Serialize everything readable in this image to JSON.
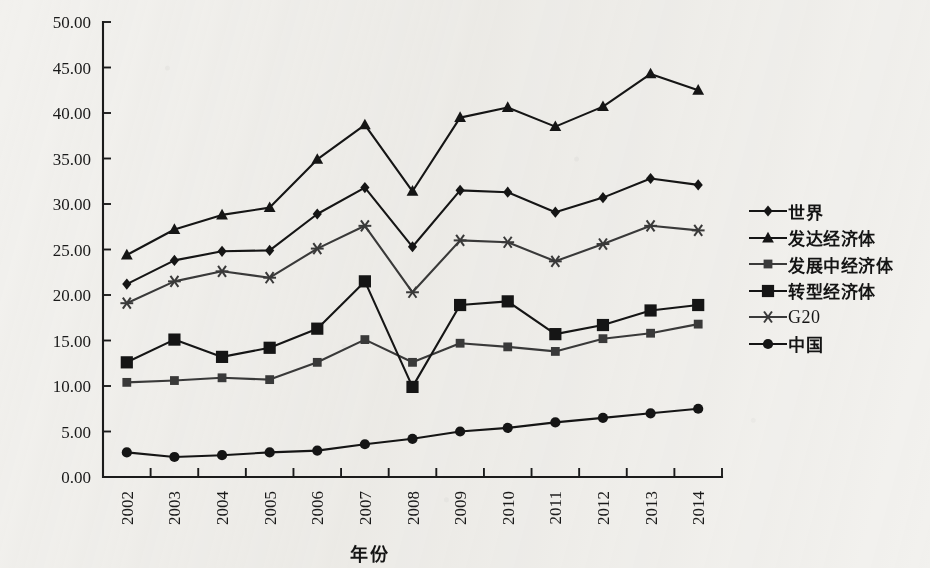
{
  "chart_data": {
    "type": "line",
    "title": "",
    "xlabel": "年份",
    "ylabel": "占比/%",
    "categories": [
      "2002",
      "2003",
      "2004",
      "2005",
      "2006",
      "2007",
      "2008",
      "2009",
      "2010",
      "2011",
      "2012",
      "2013",
      "2014"
    ],
    "x": [
      2002,
      2003,
      2004,
      2005,
      2006,
      2007,
      2008,
      2009,
      2010,
      2011,
      2012,
      2013,
      2014
    ],
    "ylim": [
      0,
      50
    ],
    "ytick_labels": [
      "0.00",
      "5.00",
      "10.00",
      "15.00",
      "20.00",
      "25.00",
      "30.00",
      "35.00",
      "40.00",
      "45.00",
      "50.00"
    ],
    "ytick_values": [
      0,
      5,
      10,
      15,
      20,
      25,
      30,
      35,
      40,
      45,
      50
    ],
    "ytick_step": 5,
    "grid": false,
    "legend_position": "right",
    "series": [
      {
        "name": "世界",
        "marker": "diamond",
        "color": "#151515",
        "values": [
          21.2,
          23.8,
          24.8,
          24.9,
          28.9,
          31.8,
          25.3,
          31.5,
          31.3,
          29.1,
          30.7,
          32.8,
          32.1
        ]
      },
      {
        "name": "发达经济体",
        "marker": "triangle",
        "color": "#151515",
        "values": [
          24.4,
          27.2,
          28.8,
          29.6,
          34.9,
          38.7,
          31.4,
          39.5,
          40.6,
          38.5,
          40.7,
          44.3,
          42.5
        ]
      },
      {
        "name": "发展中经济体",
        "marker": "square-small",
        "color": "#3a3a3a",
        "values": [
          10.4,
          10.6,
          10.9,
          10.7,
          12.6,
          15.1,
          12.6,
          14.7,
          14.3,
          13.8,
          15.2,
          15.8,
          16.8
        ]
      },
      {
        "name": "转型经济体",
        "marker": "square-large",
        "color": "#151515",
        "values": [
          12.6,
          15.1,
          13.2,
          14.2,
          16.3,
          21.5,
          9.9,
          18.9,
          19.3,
          15.7,
          16.7,
          18.3,
          18.9
        ]
      },
      {
        "name": "G20",
        "marker": "asterisk",
        "color": "#3a3a3a",
        "values": [
          19.1,
          21.5,
          22.6,
          21.9,
          25.1,
          27.6,
          20.3,
          26.0,
          25.8,
          23.7,
          25.6,
          27.6,
          27.1
        ]
      },
      {
        "name": "中国",
        "marker": "circle",
        "color": "#151515",
        "values": [
          2.7,
          2.2,
          2.4,
          2.7,
          2.9,
          3.6,
          4.2,
          5.0,
          5.4,
          6.0,
          6.5,
          7.0,
          7.5
        ]
      }
    ]
  },
  "legend": {
    "items": [
      {
        "label": "世界",
        "marker": "diamond",
        "latin": false
      },
      {
        "label": "发达经济体",
        "marker": "triangle",
        "latin": false
      },
      {
        "label": "发展中经济体",
        "marker": "square-small",
        "latin": false
      },
      {
        "label": "转型经济体",
        "marker": "square-large",
        "latin": false
      },
      {
        "label": "G20",
        "marker": "asterisk",
        "latin": true
      },
      {
        "label": "中国",
        "marker": "circle",
        "latin": false
      }
    ]
  },
  "axes": {
    "y_title": "占比/%",
    "x_title": "年份"
  }
}
